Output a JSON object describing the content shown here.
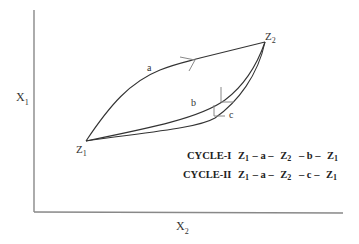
{
  "axes": {
    "y_label": "X",
    "y_label_sub": "1",
    "x_label": "X",
    "x_label_sub": "2",
    "color": "#777777"
  },
  "points": {
    "z1": {
      "label": "Z",
      "sub": "1"
    },
    "z2": {
      "label": "Z",
      "sub": "2"
    }
  },
  "paths": {
    "a": {
      "label": "a"
    },
    "b": {
      "label": "b"
    },
    "c": {
      "label": "c"
    }
  },
  "cycles": [
    {
      "name": "CYCLE-I",
      "seq": [
        {
          "t": "Z",
          "s": "1"
        },
        {
          "t": "– a –"
        },
        {
          "t": "Z",
          "s": "2"
        },
        {
          "t": "– b –"
        },
        {
          "t": "Z",
          "s": "1"
        }
      ]
    },
    {
      "name": "CYCLE-II",
      "seq": [
        {
          "t": "Z",
          "s": "1"
        },
        {
          "t": "– a –"
        },
        {
          "t": "Z",
          "s": "2"
        },
        {
          "t": "– c –"
        },
        {
          "t": "Z",
          "s": "1"
        }
      ]
    }
  ],
  "colors": {
    "line": "#333333",
    "arrow": "#888888"
  }
}
